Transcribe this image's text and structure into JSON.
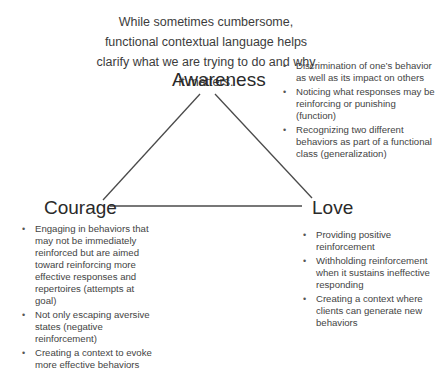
{
  "title": "While sometimes cumbersome, functional contextual language helps clarify what we are trying to do and why it matters.",
  "nodes": {
    "awareness": {
      "label": "Awareness",
      "bullets": [
        "Discrimination of one’s behavior as well as its impact on others",
        "Noticing what responses may be reinforcing or punishing (function)",
        "Recognizing two different behaviors as part of a functional class (generalization)"
      ]
    },
    "courage": {
      "label": "Courage",
      "bullets": [
        "Engaging in behaviors that may not be immediately reinforced but are aimed toward reinforcing more effective responses and repertoires (attempts at goal)",
        "Not only escaping aversive states (negative reinforcement)",
        "Creating a context to evoke more effective behaviors"
      ]
    },
    "love": {
      "label": "Love",
      "bullets": [
        "Providing positive reinforcement",
        "Withholding reinforcement when it sustains ineffective responding",
        "Creating a context where clients can generate new behaviors"
      ]
    }
  },
  "colors": {
    "line": "#4a4a4a",
    "text": "#3a3a3a"
  }
}
